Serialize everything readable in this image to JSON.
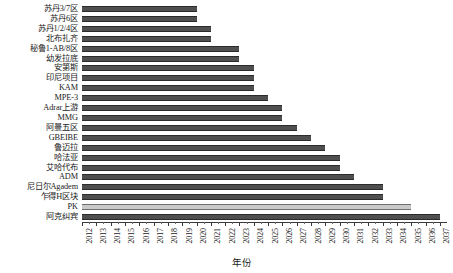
{
  "chart_data": {
    "type": "bar",
    "orientation": "horizontal",
    "title": "",
    "xlabel": "年份",
    "ylabel": "",
    "xlim": [
      2012,
      2037.5
    ],
    "grid": false,
    "legend": null,
    "tick_labels": [
      "2012",
      "2013",
      "2014",
      "2015",
      "2016",
      "2017",
      "2018",
      "2019",
      "2020",
      "2021",
      "2022",
      "2023",
      "2024",
      "2025",
      "2026",
      "2027",
      "2028",
      "2029",
      "2030",
      "2031",
      "2032",
      "2033",
      "2034",
      "2035",
      "2036",
      "2037"
    ],
    "categories": [
      "苏丹3/7区",
      "苏丹6区",
      "苏丹1/2/4区",
      "北布扎齐",
      "秘鲁1-AB/8区",
      "幼发拉底",
      "安第斯",
      "印尼项目",
      "KAM",
      "MPE-3",
      "Adrar上游",
      "MMG",
      "阿曼五区",
      "GBEIBE",
      "鲁迈拉",
      "哈法亚",
      "艾哈代布",
      "ADM",
      "尼日尔Agadem",
      "乍得H区块",
      "PK",
      "阿克纠宾"
    ],
    "start_year": 2012,
    "end_years": [
      2020,
      2020,
      2021,
      2021,
      2023,
      2023,
      2024,
      2024,
      2024,
      2025,
      2026,
      2026,
      2027,
      2028,
      2029,
      2030,
      2030,
      2031,
      2033,
      2033,
      2035,
      2037
    ],
    "bar_styles": [
      "dark",
      "dark",
      "dark",
      "dark",
      "dark",
      "dark",
      "dark",
      "dark",
      "dark",
      "dark",
      "dark",
      "dark",
      "dark",
      "dark",
      "dark",
      "dark",
      "dark",
      "dark",
      "dark",
      "dark",
      "light",
      "dark"
    ]
  }
}
